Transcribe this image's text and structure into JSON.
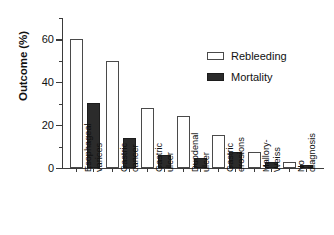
{
  "chart_data": {
    "type": "bar",
    "title": "",
    "xlabel": "",
    "ylabel": "Outcome (%)",
    "ylim": [
      0,
      70
    ],
    "yticks": [
      0,
      20,
      40,
      60
    ],
    "yticks_minor": [
      10,
      30,
      50,
      70
    ],
    "grid": false,
    "legend_position": "upper-right",
    "categories": [
      "Esophageal varices",
      "Gastric cancer",
      "Gastric ulcer",
      "Duodenal ulcer",
      "Gastric erosions",
      "Mallory-Weiss",
      "No diagnosis"
    ],
    "category_lines": [
      [
        "Esophageal",
        "varices"
      ],
      [
        "Gastric",
        "cancer"
      ],
      [
        "Gastric",
        "ulcer"
      ],
      [
        "Duodenal",
        "ulcer"
      ],
      [
        "Gastric",
        "erosions"
      ],
      [
        "Mallory-",
        "Weiss"
      ],
      [
        "No",
        "diagnosis"
      ]
    ],
    "series": [
      {
        "name": "Rebleeding",
        "color": "#ffffff",
        "edge_color": "#4a4a4a",
        "values": [
          60,
          50,
          28,
          24.5,
          15.5,
          7.5,
          3
        ]
      },
      {
        "name": "Mortality",
        "color": "#2b2b2b",
        "edge_color": "#1c1c1c",
        "values": [
          30.5,
          14,
          6,
          4.5,
          7.5,
          3,
          1.5
        ]
      }
    ]
  },
  "axis": {
    "y_title": "Outcome (%)",
    "tick_labels": [
      "0",
      "20",
      "40",
      "60"
    ]
  },
  "legend": {
    "items": [
      {
        "label": "Rebleeding"
      },
      {
        "label": "Mortality"
      }
    ]
  }
}
